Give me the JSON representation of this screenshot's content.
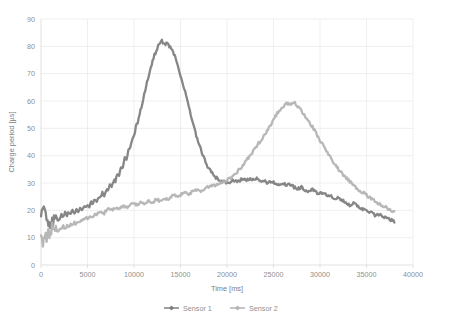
{
  "chart_data": {
    "type": "line",
    "title": "",
    "xlabel": "Time [ms]",
    "ylabel": "Charge period [µs]",
    "xlim": [
      0,
      40000
    ],
    "ylim": [
      0,
      90
    ],
    "xticks": [
      "0",
      "5000",
      "10000",
      "15000",
      "20000",
      "25000",
      "30000",
      "35000",
      "40000"
    ],
    "yticks": [
      "0",
      "10",
      "20",
      "30",
      "40",
      "50",
      "60",
      "70",
      "80",
      "90"
    ],
    "grid": true,
    "legend_position": "bottom-center",
    "colors": {
      "sensor1": "#808080",
      "sensor2": "#b3b3b3",
      "gridline": "#e8e8e8",
      "axis": "#d9d9d9",
      "text": "#8f8f8f",
      "background": "#ffffff"
    },
    "series": [
      {
        "name": "Sensor 1",
        "color": "#808080",
        "marker": "diamond",
        "x": [
          0,
          200,
          400,
          600,
          800,
          1000,
          1200,
          1400,
          1600,
          1800,
          2000,
          2200,
          2400,
          2600,
          2800,
          3000,
          3200,
          3400,
          3600,
          3800,
          4000,
          4200,
          4400,
          4600,
          4800,
          5000,
          5200,
          5400,
          5600,
          5800,
          6000,
          6200,
          6400,
          6600,
          6800,
          7000,
          7200,
          7400,
          7600,
          7800,
          8000,
          8200,
          8400,
          8600,
          8800,
          9000,
          9200,
          9400,
          9600,
          9800,
          10000,
          10200,
          10400,
          10600,
          10800,
          11000,
          11200,
          11400,
          11600,
          11800,
          12000,
          12200,
          12400,
          12600,
          12800,
          13000,
          13200,
          13400,
          13600,
          13800,
          14000,
          14200,
          14400,
          14600,
          14800,
          15000,
          15200,
          15400,
          15600,
          15800,
          16000,
          16200,
          16400,
          16600,
          16800,
          17000,
          17200,
          17400,
          17600,
          17800,
          18000,
          18400,
          18800,
          19200,
          19600,
          20000,
          20400,
          20800,
          21200,
          21600,
          22000,
          22400,
          22800,
          23200,
          23600,
          24000,
          24400,
          24800,
          25200,
          25600,
          26000,
          26400,
          26800,
          27200,
          27600,
          28000,
          28400,
          28800,
          29200,
          29600,
          30000,
          30400,
          30800,
          31200,
          31600,
          32000,
          32400,
          32800,
          33200,
          33600,
          34000,
          34400,
          34800,
          35200,
          35600,
          36000,
          36400,
          36800,
          37200,
          37600,
          38000
        ],
        "y": [
          20.5,
          18.0,
          21.0,
          14.5,
          16.5,
          15.0,
          17.5,
          15.5,
          18.5,
          16.5,
          17.0,
          18.5,
          17.5,
          19.0,
          18.0,
          19.5,
          18.5,
          20.0,
          19.0,
          20.5,
          19.5,
          21.0,
          20.0,
          21.5,
          21.0,
          22.0,
          21.5,
          23.0,
          22.5,
          24.0,
          23.5,
          25.0,
          24.5,
          26.5,
          25.5,
          27.5,
          27.0,
          29.0,
          28.5,
          31.0,
          30.5,
          33.5,
          33.0,
          36.0,
          35.5,
          39.0,
          38.5,
          42.0,
          42.5,
          46.0,
          47.0,
          50.5,
          52.0,
          55.5,
          57.5,
          61.0,
          63.5,
          67.0,
          69.5,
          72.5,
          74.5,
          77.0,
          78.0,
          80.0,
          81.5,
          82.0,
          81.0,
          80.5,
          81.5,
          80.0,
          79.5,
          78.0,
          76.5,
          74.0,
          72.0,
          69.5,
          67.0,
          64.5,
          62.0,
          59.0,
          56.5,
          53.5,
          51.0,
          48.5,
          46.0,
          44.0,
          42.0,
          40.0,
          38.5,
          37.0,
          35.5,
          33.5,
          32.0,
          31.0,
          30.5,
          30.0,
          30.5,
          31.0,
          30.5,
          31.5,
          31.0,
          31.5,
          31.0,
          31.5,
          30.5,
          31.0,
          30.0,
          30.5,
          30.0,
          29.5,
          30.0,
          29.0,
          29.5,
          28.5,
          28.0,
          28.5,
          27.5,
          27.0,
          27.5,
          26.5,
          26.0,
          26.5,
          25.5,
          25.0,
          24.0,
          24.5,
          23.5,
          23.0,
          22.0,
          22.5,
          21.5,
          21.0,
          20.0,
          19.5,
          19.0,
          18.0,
          18.5,
          17.5,
          17.0,
          16.5,
          16.0
        ]
      },
      {
        "name": "Sensor 2",
        "color": "#b3b3b3",
        "marker": "diamond",
        "x": [
          0,
          200,
          400,
          600,
          800,
          1000,
          1200,
          1400,
          1600,
          1800,
          2000,
          2200,
          2400,
          2600,
          2800,
          3000,
          3200,
          3400,
          3600,
          3800,
          4000,
          4400,
          4800,
          5200,
          5600,
          6000,
          6400,
          6800,
          7200,
          7600,
          8000,
          8400,
          8800,
          9200,
          9600,
          10000,
          10400,
          10800,
          11200,
          11600,
          12000,
          12400,
          12800,
          13200,
          13600,
          14000,
          14400,
          14800,
          15200,
          15600,
          16000,
          16400,
          16800,
          17200,
          17600,
          18000,
          18400,
          18800,
          19200,
          19600,
          20000,
          20400,
          20800,
          21200,
          21600,
          22000,
          22400,
          22800,
          23200,
          23600,
          24000,
          24400,
          24800,
          25200,
          25600,
          26000,
          26400,
          26800,
          27200,
          27600,
          28000,
          28400,
          28800,
          29200,
          29600,
          30000,
          30400,
          30800,
          31200,
          31600,
          32000,
          32400,
          32800,
          33200,
          33600,
          34000,
          34400,
          34800,
          35200,
          35600,
          36000,
          36400,
          36800,
          37200,
          37600,
          38000
        ],
        "y": [
          11.0,
          7.0,
          12.5,
          9.0,
          13.0,
          10.0,
          13.5,
          11.0,
          14.0,
          12.0,
          13.5,
          13.0,
          14.0,
          13.5,
          14.5,
          14.0,
          15.0,
          14.5,
          15.5,
          15.0,
          16.0,
          16.5,
          17.0,
          17.5,
          18.0,
          18.5,
          19.5,
          19.0,
          20.5,
          20.0,
          21.0,
          20.5,
          21.5,
          21.0,
          22.0,
          22.5,
          22.0,
          23.0,
          22.5,
          23.5,
          23.0,
          24.0,
          23.5,
          24.5,
          24.0,
          25.0,
          25.5,
          25.0,
          26.0,
          26.5,
          26.0,
          27.0,
          27.5,
          27.0,
          28.0,
          28.5,
          29.0,
          29.5,
          30.0,
          30.5,
          31.0,
          32.0,
          33.0,
          34.5,
          36.0,
          38.0,
          39.5,
          41.5,
          43.5,
          45.5,
          47.5,
          49.5,
          52.0,
          54.5,
          56.5,
          58.0,
          59.0,
          58.5,
          59.5,
          58.0,
          56.5,
          54.5,
          52.5,
          50.5,
          48.0,
          45.5,
          43.5,
          41.0,
          39.0,
          37.0,
          35.0,
          33.5,
          32.0,
          30.5,
          29.5,
          28.0,
          27.0,
          26.0,
          25.0,
          24.0,
          23.0,
          22.5,
          21.5,
          21.0,
          20.0,
          19.5
        ]
      }
    ]
  },
  "legend": {
    "items": [
      {
        "label": "Sensor 1"
      },
      {
        "label": "Sensor 2"
      }
    ]
  },
  "icons": {
    "legend_marker": "diamond-marker-icon"
  }
}
